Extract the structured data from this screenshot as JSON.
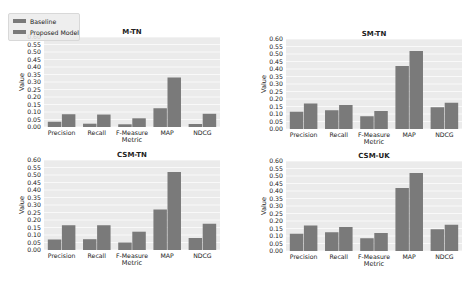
{
  "legend": {
    "items": [
      {
        "label": "Baseline"
      },
      {
        "label": "Proposed Model"
      }
    ]
  },
  "colors": {
    "bar": "#7a7a7a",
    "plot_background": "#ebebeb",
    "grid": "#ffffff"
  },
  "chart_data": [
    {
      "type": "bar",
      "title": "M-TN",
      "xlabel": "Metric",
      "ylabel": "Value",
      "categories": [
        "Precision",
        "Recall",
        "F-Measure",
        "MAP",
        "NDCG"
      ],
      "ylim": [
        0,
        0.6
      ],
      "yticks": [
        "0.00",
        "0.05",
        "0.10",
        "0.15",
        "0.20",
        "0.25",
        "0.30",
        "0.35",
        "0.40",
        "0.45",
        "0.50",
        "0.55",
        "0.60"
      ],
      "grid": true,
      "legend_position": "top-left",
      "series": [
        {
          "name": "Baseline",
          "values": [
            0.035,
            0.022,
            0.018,
            0.125,
            0.02
          ]
        },
        {
          "name": "Proposed Model",
          "values": [
            0.085,
            0.083,
            0.058,
            0.33,
            0.088
          ]
        }
      ]
    },
    {
      "type": "bar",
      "title": "SM-TN",
      "xlabel": "Metric",
      "ylabel": "Value",
      "categories": [
        "Precision",
        "Recall",
        "F-Measure",
        "MAP",
        "NDCG"
      ],
      "ylim": [
        0,
        0.6
      ],
      "yticks": [
        "0.00",
        "0.05",
        "0.10",
        "0.15",
        "0.20",
        "0.25",
        "0.30",
        "0.35",
        "0.40",
        "0.45",
        "0.50",
        "0.55",
        "0.60"
      ],
      "grid": true,
      "series": [
        {
          "name": "Baseline",
          "values": [
            0.115,
            0.125,
            0.085,
            0.42,
            0.145
          ]
        },
        {
          "name": "Proposed Model",
          "values": [
            0.17,
            0.16,
            0.12,
            0.52,
            0.175
          ]
        }
      ]
    },
    {
      "type": "bar",
      "title": "CSM-TN",
      "xlabel": "Metric",
      "ylabel": "Value",
      "categories": [
        "Precision",
        "Recall",
        "F-Measure",
        "MAP",
        "NDCG"
      ],
      "ylim": [
        0,
        0.6
      ],
      "yticks": [
        "0.00",
        "0.05",
        "0.10",
        "0.15",
        "0.20",
        "0.25",
        "0.30",
        "0.35",
        "0.40",
        "0.45",
        "0.50",
        "0.55",
        "0.60"
      ],
      "grid": true,
      "series": [
        {
          "name": "Baseline",
          "values": [
            0.07,
            0.072,
            0.05,
            0.27,
            0.08
          ]
        },
        {
          "name": "Proposed Model",
          "values": [
            0.165,
            0.165,
            0.122,
            0.52,
            0.175
          ]
        }
      ]
    },
    {
      "type": "bar",
      "title": "CSM-UK",
      "xlabel": "Metric",
      "ylabel": "Value",
      "categories": [
        "Precision",
        "Recall",
        "F-Measure",
        "MAP",
        "NDCG"
      ],
      "ylim": [
        0,
        0.6
      ],
      "yticks": [
        "0.00",
        "0.05",
        "0.10",
        "0.15",
        "0.20",
        "0.25",
        "0.30",
        "0.35",
        "0.40",
        "0.45",
        "0.50",
        "0.55",
        "0.60"
      ],
      "grid": true,
      "series": [
        {
          "name": "Baseline",
          "values": [
            0.115,
            0.125,
            0.085,
            0.42,
            0.145
          ]
        },
        {
          "name": "Proposed Model",
          "values": [
            0.17,
            0.16,
            0.12,
            0.52,
            0.175
          ]
        }
      ]
    }
  ]
}
